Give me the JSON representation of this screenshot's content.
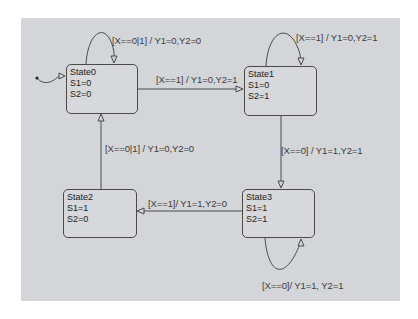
{
  "diagram": {
    "type": "state-machine",
    "colors": {
      "canvas": "#d3d5d9",
      "state_fill": "#d6d8db",
      "stroke": "#4a4a4a",
      "text": "#3c3c3c"
    },
    "initial_state": "State0",
    "states": [
      {
        "name": "State0",
        "s1": "S1=0",
        "s2": "S2=0"
      },
      {
        "name": "State1",
        "s1": "S1=0",
        "s2": "S2=1"
      },
      {
        "name": "State2",
        "s1": "S1=1",
        "s2": "S2=0"
      },
      {
        "name": "State3",
        "s1": "S1=1",
        "s2": "S2=1"
      }
    ],
    "transitions": [
      {
        "from": "State0",
        "to": "State0",
        "label": "[X==0|1] / Y1=0,Y2=0"
      },
      {
        "from": "State0",
        "to": "State1",
        "label": "[X==1] / Y1=0,Y2=1"
      },
      {
        "from": "State1",
        "to": "State1",
        "label": "[X==1] / Y1=0,Y2=1"
      },
      {
        "from": "State1",
        "to": "State3",
        "label": "[X==0] / Y1=1,Y2=1"
      },
      {
        "from": "State3",
        "to": "State2",
        "label": "[X==1]/ Y1=1,Y2=0"
      },
      {
        "from": "State3",
        "to": "State3",
        "label": "[X==0]/ Y1=1, Y2=1"
      },
      {
        "from": "State2",
        "to": "State0",
        "label": "[X==0|1] / Y1=0,Y2=0"
      }
    ]
  }
}
